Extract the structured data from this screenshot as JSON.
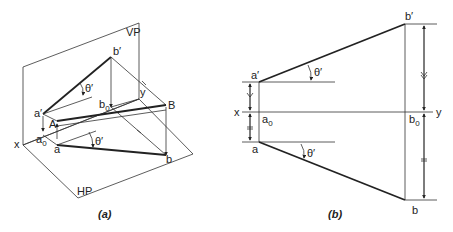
{
  "figure_a": {
    "caption": "(a)",
    "planes": {
      "vertical": "VP",
      "horizontal": "HP"
    },
    "axis": {
      "x": "x",
      "y": "y"
    },
    "points": {
      "a_prime": "a′",
      "b_prime": "b′",
      "A": "A",
      "B": "B",
      "a": "a",
      "b": "b",
      "a0": "a",
      "a0_sub": "0",
      "b0": "b",
      "b0_sub": "0"
    },
    "angles": {
      "upper": "θ′",
      "lower": "θ′"
    }
  },
  "figure_b": {
    "caption": "(b)",
    "axis": {
      "x": "x",
      "y": "y"
    },
    "points": {
      "a_prime": "a′",
      "b_prime": "b′",
      "a": "a",
      "b": "b",
      "a0": "a",
      "a0_sub": "0",
      "b0": "b",
      "b0_sub": "0"
    },
    "angles": {
      "upper": "θ′",
      "lower": "θ′"
    }
  }
}
